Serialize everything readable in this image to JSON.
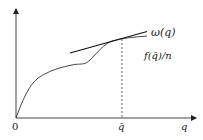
{
  "diagram": {
    "type": "function-plot",
    "labels": {
      "curve": "ω(q)",
      "tangent": "f(q̄)/n",
      "origin": "0",
      "q_bar": "q̄",
      "x_axis": "q"
    },
    "elements": [
      "y-axis with arrow",
      "x-axis with arrow",
      "curve ω(q)",
      "tangent line at q̄",
      "dashed vertical line at q̄"
    ],
    "colors": {
      "line": "#222222",
      "background": "#ffffff"
    }
  }
}
